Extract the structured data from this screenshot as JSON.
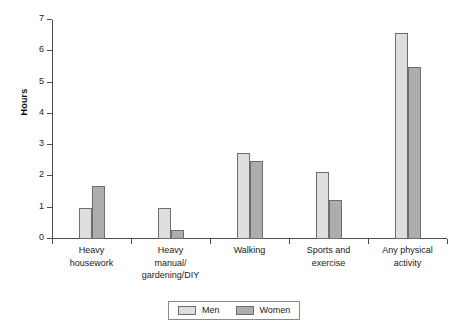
{
  "chart_data": {
    "type": "bar",
    "title": "",
    "xlabel": "",
    "ylabel": "Hours",
    "ylim": [
      0,
      7
    ],
    "yticks": [
      0,
      1,
      2,
      3,
      4,
      5,
      6,
      7
    ],
    "ytick_labels": [
      "0",
      "1",
      "2",
      "3",
      "4",
      "5",
      "6",
      "7"
    ],
    "grid": false,
    "legend_position": "bottom-center",
    "categories": [
      "Heavy\nhousework",
      "Heavy\nmanual/\ngardening/DIY",
      "Walking",
      "Sports and\nexercise",
      "Any physical\nactivity"
    ],
    "series": [
      {
        "name": "Men",
        "color": "#dedede",
        "values": [
          1.0,
          1.0,
          2.75,
          2.15,
          6.6
        ]
      },
      {
        "name": "Women",
        "color": "#adadad",
        "values": [
          1.7,
          0.3,
          2.5,
          1.25,
          5.5
        ]
      }
    ]
  },
  "legend": {
    "items": [
      {
        "label": "Men",
        "swatch": "men"
      },
      {
        "label": "Women",
        "swatch": "women"
      }
    ]
  },
  "axis": {
    "y_title": "Hours"
  }
}
